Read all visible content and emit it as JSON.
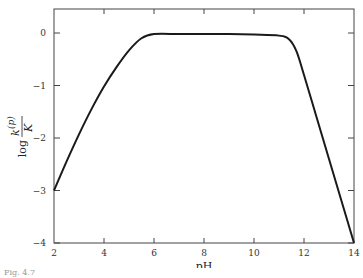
{
  "chart_data": {
    "type": "line",
    "title": "",
    "xlabel": "pH",
    "ylabel": "log k(p)/K",
    "ylabel_parts": {
      "prefix": "log",
      "numerator": "k",
      "superscript": "(p)",
      "denominator": "K"
    },
    "xlim": [
      2,
      14
    ],
    "ylim": [
      -4,
      0.5
    ],
    "xticks": [
      2,
      4,
      6,
      8,
      10,
      12,
      14
    ],
    "yticks": [
      0,
      -1,
      -2,
      -3,
      -4
    ],
    "grid": false,
    "legend": null,
    "series": [
      {
        "name": "log k(p)/K",
        "x": [
          2,
          2.5,
          3,
          3.5,
          4,
          4.5,
          5,
          5.5,
          6,
          7,
          8,
          9,
          10,
          11,
          11.4,
          11.7,
          12,
          12.5,
          13,
          13.5,
          14
        ],
        "y": [
          -3.0,
          -2.45,
          -1.93,
          -1.45,
          -1.02,
          -0.65,
          -0.33,
          -0.1,
          -0.02,
          -0.02,
          -0.02,
          -0.02,
          -0.03,
          -0.05,
          -0.12,
          -0.35,
          -0.8,
          -1.6,
          -2.4,
          -3.2,
          -4.0
        ]
      }
    ]
  },
  "caption": "Fig. 4.7"
}
